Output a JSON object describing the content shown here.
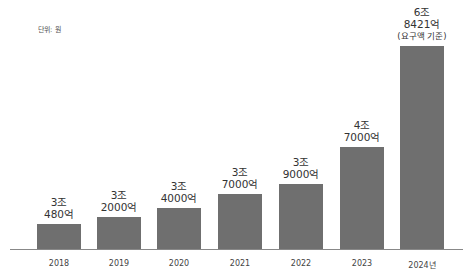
{
  "chart_data": {
    "type": "bar",
    "title": "",
    "unit_label": "단위: 원",
    "xlabel": "",
    "ylabel": "",
    "categories": [
      "2018",
      "2019",
      "2020",
      "2021",
      "2022",
      "2023",
      "2024년"
    ],
    "values": [
      30480,
      32000,
      34000,
      37000,
      39000,
      47000,
      68421
    ],
    "value_unit": "억 원",
    "data_labels": [
      [
        "3조",
        "480억"
      ],
      [
        "3조",
        "2000억"
      ],
      [
        "3조",
        "4000억"
      ],
      [
        "3조",
        "7000억"
      ],
      [
        "3조",
        "9000억"
      ],
      [
        "4조",
        "7000억"
      ],
      [
        "6조",
        "8421억",
        "(요구액 기준)"
      ]
    ],
    "annotations": [
      "2024년 값은 요구액 기준"
    ],
    "grid": false,
    "legend": null,
    "bar_color": "#6f6f6f",
    "ylim": [
      0,
      70000
    ]
  },
  "layout": {
    "baseline_y": 250,
    "plot_top_y": 46,
    "bar_width": 44,
    "bar_lefts": [
      37,
      97,
      157,
      218,
      279,
      340,
      400
    ]
  }
}
